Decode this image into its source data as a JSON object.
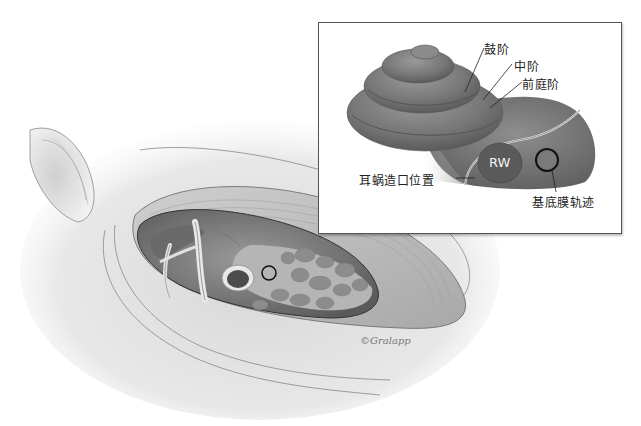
{
  "figure": {
    "type": "anatomical-illustration",
    "colors": {
      "background": "#ffffff",
      "tissue_light": "#e6e6e6",
      "tissue_mid": "#b8b8b8",
      "cochlea_dark": "#6e6e6e",
      "cochlea_mid": "#8a8a8a",
      "rw_fill": "#5a5a5a",
      "outline": "#222222",
      "inset_border": "#555555"
    }
  },
  "inset": {
    "labels": {
      "scala_tympani": "鼓阶",
      "scala_media": "中阶",
      "scala_vestibuli": "前庭阶",
      "cochleostomy_site": "耳蜗造口位置",
      "basilar_membrane_track": "基底膜轨迹",
      "round_window": "RW"
    }
  },
  "main_view": {
    "signature": "©Gralapp"
  }
}
